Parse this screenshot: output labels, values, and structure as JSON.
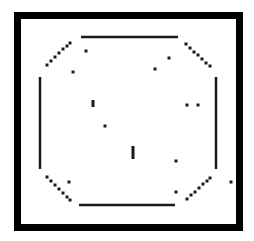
{
  "game": {
    "colors": {
      "background": "#ffffff",
      "frame": "#000000",
      "wall": "#1a1a1a",
      "pellet": "#1a1a1a"
    },
    "walls": {
      "top": {
        "x1": 81,
        "y1": 37,
        "x2": 178,
        "y2": 37
      },
      "bottom": {
        "x1": 79,
        "y1": 205,
        "x2": 175,
        "y2": 205
      },
      "left": {
        "x1": 40,
        "y1": 77,
        "x2": 40,
        "y2": 169
      },
      "right": {
        "x1": 216,
        "y1": 77,
        "x2": 216,
        "y2": 169
      }
    },
    "diagonals": {
      "top_left": [
        [
          47,
          65
        ],
        [
          51,
          61
        ],
        [
          55,
          57
        ],
        [
          59,
          53
        ],
        [
          63,
          49
        ],
        [
          67,
          46
        ],
        [
          70,
          43
        ]
      ],
      "top_right": [
        [
          186,
          44
        ],
        [
          190,
          48
        ],
        [
          194,
          52
        ],
        [
          198,
          55
        ],
        [
          202,
          59
        ],
        [
          206,
          63
        ],
        [
          210,
          66
        ]
      ],
      "bottom_left": [
        [
          47,
          177
        ],
        [
          51,
          181
        ],
        [
          55,
          185
        ],
        [
          59,
          189
        ],
        [
          63,
          193
        ],
        [
          67,
          197
        ],
        [
          70,
          200
        ]
      ],
      "bottom_right": [
        [
          187,
          199
        ],
        [
          191,
          195
        ],
        [
          195,
          192
        ],
        [
          199,
          188
        ],
        [
          203,
          184
        ],
        [
          207,
          181
        ],
        [
          210,
          178
        ]
      ]
    },
    "pellets": [
      {
        "x": 86,
        "y": 51
      },
      {
        "x": 73,
        "y": 72
      },
      {
        "x": 169,
        "y": 58
      },
      {
        "x": 155,
        "y": 69
      },
      {
        "x": 105,
        "y": 126
      },
      {
        "x": 187,
        "y": 105
      },
      {
        "x": 198,
        "y": 105
      },
      {
        "x": 176,
        "y": 161
      },
      {
        "x": 69,
        "y": 182
      },
      {
        "x": 176,
        "y": 192
      },
      {
        "x": 231,
        "y": 182
      }
    ],
    "bars": [
      {
        "x": 93,
        "y1": 100,
        "y2": 107
      },
      {
        "x": 133,
        "y1": 146,
        "y2": 159
      }
    ]
  }
}
